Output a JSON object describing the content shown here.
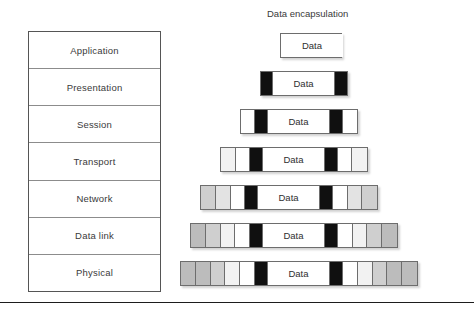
{
  "osi": {
    "name": "osi-layer-stack",
    "layers": [
      {
        "label": "Application"
      },
      {
        "label": "Presentation"
      },
      {
        "label": "Session"
      },
      {
        "label": "Transport"
      },
      {
        "label": "Network"
      },
      {
        "label": "Data link"
      },
      {
        "label": "Physical"
      }
    ]
  },
  "encapsulation": {
    "title": "Data encapsulation",
    "data_label": "Data",
    "colors": {
      "black_header": "#101010",
      "white": "#ffffff",
      "gray_light": "#f2f2f2",
      "gray_mid": "#e3e3e3",
      "gray_dark": "#cfcfcf",
      "gray_darker": "#bcbcbc",
      "border": "#6d6d6d"
    },
    "rows": [
      {
        "layer": "Application",
        "left": 100,
        "top": 0,
        "data_width": 62,
        "left_segments": [],
        "right_segments": []
      },
      {
        "layer": "Presentation",
        "left": 80,
        "top": 38,
        "data_width": 62,
        "left_segments": [
          "black_header"
        ],
        "right_segments": [
          "black_header"
        ]
      },
      {
        "layer": "Session",
        "left": 60,
        "top": 76,
        "data_width": 62,
        "left_segments": [
          "white",
          "black_header"
        ],
        "right_segments": [
          "black_header",
          "white"
        ]
      },
      {
        "layer": "Transport",
        "left": 40,
        "top": 114,
        "data_width": 62,
        "left_segments": [
          "gray_light",
          "white",
          "black_header"
        ],
        "right_segments": [
          "black_header",
          "white",
          "gray_light"
        ]
      },
      {
        "layer": "Network",
        "left": 20,
        "top": 152,
        "data_width": 62,
        "left_segments": [
          "gray_dark",
          "gray_mid",
          "white",
          "black_header"
        ],
        "right_segments": [
          "black_header",
          "white",
          "gray_mid",
          "gray_dark"
        ]
      },
      {
        "layer": "Data link",
        "left": 10,
        "top": 190,
        "data_width": 62,
        "left_segments": [
          "gray_darker",
          "gray_dark",
          "gray_light",
          "white",
          "black_header"
        ],
        "right_segments": [
          "black_header",
          "white",
          "gray_light",
          "gray_dark",
          "gray_darker"
        ]
      },
      {
        "layer": "Physical",
        "left": 0,
        "top": 228,
        "data_width": 62,
        "left_segments": [
          "gray_darker",
          "gray_darker",
          "gray_dark",
          "gray_light",
          "white",
          "black_header"
        ],
        "right_segments": [
          "black_header",
          "white",
          "gray_light",
          "gray_dark",
          "gray_darker",
          "gray_darker"
        ]
      }
    ]
  },
  "footer": {
    "rule": true
  }
}
